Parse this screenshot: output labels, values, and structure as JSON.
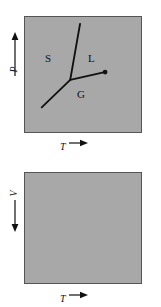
{
  "figure": {
    "type": "phase-diagram-pair",
    "background_color": "#ffffff",
    "panel_fill_color": "#a8a8a8",
    "panel_border_color": "#555555",
    "line_color": "#111111"
  },
  "top_panel": {
    "name": "pressure-temperature-phase-diagram",
    "x_axis": {
      "symbol": "T",
      "arrow": "→"
    },
    "y_axis": {
      "symbol": "P",
      "arrow": "↑"
    },
    "regions": [
      {
        "id": "solid",
        "label": "S"
      },
      {
        "id": "liquid",
        "label": "L"
      },
      {
        "id": "gas",
        "label": "G"
      }
    ],
    "curves": [
      {
        "id": "fusion-curve",
        "from": [
          46,
          64
        ],
        "to": [
          55,
          6
        ]
      },
      {
        "id": "sublimation-curve",
        "from": [
          46,
          64
        ],
        "to": [
          17,
          92
        ]
      },
      {
        "id": "vaporization-curve",
        "from": [
          46,
          64
        ],
        "to": [
          81,
          56
        ]
      }
    ],
    "points": [
      {
        "id": "triple-point",
        "at": [
          46,
          64
        ],
        "marker": "none"
      },
      {
        "id": "critical-point",
        "at": [
          81,
          56
        ],
        "marker": "dot"
      }
    ]
  },
  "bottom_panel": {
    "name": "volume-temperature-diagram",
    "x_axis": {
      "symbol": "T",
      "arrow": "→"
    },
    "y_axis": {
      "symbol": "V",
      "arrow": "↓"
    },
    "content": "empty"
  }
}
